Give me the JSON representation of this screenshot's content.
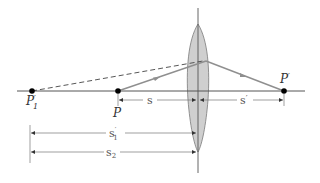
{
  "diagram": {
    "type": "optics-thin-lens-ray-diagram",
    "colors": {
      "axis": "#555555",
      "ray": "#8f8f8f",
      "dashed_ray": "#444444",
      "lens_fill": "#cfcfcf",
      "lens_stroke": "#7a7a7a",
      "point": "#000000",
      "dimension": "#777777",
      "text": "#333333"
    },
    "points": {
      "p1_prime": {
        "label": "P",
        "sup": "′",
        "sub": "1"
      },
      "p": {
        "label": "P"
      },
      "p_prime": {
        "label": "P",
        "sup": "′"
      }
    },
    "dimensions": {
      "s": {
        "label": "s"
      },
      "s_prime": {
        "label": "s",
        "sup": "′"
      },
      "s1_prime": {
        "label": "s",
        "sup": "′",
        "sub": "1"
      },
      "s2": {
        "label": "s",
        "sub": "2"
      }
    }
  }
}
